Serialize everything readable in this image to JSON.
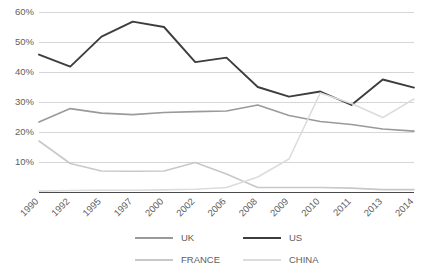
{
  "chart_data": {
    "type": "line",
    "title": "",
    "subtitle": "",
    "xlabel": "",
    "ylabel": "",
    "ylim": [
      0,
      60
    ],
    "ytick_labels": [
      "10%",
      "20%",
      "30%",
      "40%",
      "50%",
      "60%"
    ],
    "ytick_values": [
      10,
      20,
      30,
      40,
      50,
      60
    ],
    "grid": true,
    "legend_position": "bottom",
    "categories": [
      "1990",
      "1992",
      "1995",
      "1997",
      "2000",
      "2002",
      "2006",
      "2008",
      "2009",
      "2010",
      "2011",
      "2013",
      "2014"
    ],
    "series": [
      {
        "name": "UK",
        "color": "#9a9a9a",
        "width": 1.6,
        "values": [
          23.3,
          27.8,
          26.3,
          25.8,
          26.5,
          26.8,
          27.0,
          29.0,
          25.5,
          23.5,
          22.5,
          21.0,
          20.3
        ]
      },
      {
        "name": "US",
        "color": "#3d3d3d",
        "width": 1.9,
        "values": [
          45.8,
          41.8,
          51.8,
          56.8,
          55.0,
          43.3,
          44.8,
          35.0,
          31.8,
          33.5,
          29.0,
          37.5,
          34.8
        ]
      },
      {
        "name": "FRANCE",
        "color": "#c8c8c8",
        "width": 1.6,
        "values": [
          17.0,
          9.5,
          7.0,
          6.9,
          7.0,
          9.8,
          6.0,
          1.5,
          1.5,
          1.5,
          1.3,
          0.8,
          0.8
        ]
      },
      {
        "name": "CHINA",
        "color": "#dcdcdc",
        "width": 1.6,
        "values": [
          0.3,
          0.5,
          0.6,
          0.6,
          0.7,
          0.9,
          1.5,
          5.0,
          11.0,
          33.0,
          29.5,
          24.8,
          31.0
        ]
      }
    ]
  },
  "legend": {
    "entries": [
      {
        "label": "UK"
      },
      {
        "label": "US"
      },
      {
        "label": "FRANCE"
      },
      {
        "label": "CHINA"
      }
    ]
  }
}
